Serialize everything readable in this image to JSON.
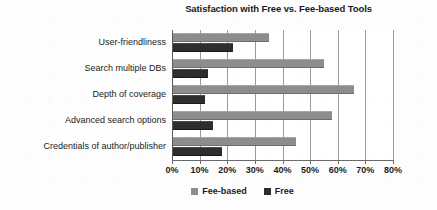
{
  "chart_data": {
    "type": "bar",
    "orientation": "horizontal",
    "title": "Satisfaction with Free vs. Fee-based Tools",
    "xlabel": "",
    "ylabel": "",
    "xlim": [
      0,
      80
    ],
    "xtick_labels": [
      "0%",
      "10%",
      "20%",
      "30%",
      "40%",
      "50%",
      "60%",
      "70%",
      "80%"
    ],
    "xticks": [
      0,
      10,
      20,
      30,
      40,
      50,
      60,
      70,
      80
    ],
    "grid": "vertical",
    "legend_position": "bottom",
    "categories": [
      "User-friendliness",
      "Search multiple DBs",
      "Depth of coverage",
      "Advanced search options",
      "Credentials of author/publisher"
    ],
    "series": [
      {
        "name": "Fee-based",
        "color": "#8d8d8d",
        "values": [
          35,
          55,
          66,
          58,
          45
        ]
      },
      {
        "name": "Free",
        "color": "#2e2e2e",
        "values": [
          22,
          13,
          12,
          15,
          18
        ]
      }
    ]
  },
  "legend": {
    "items": [
      {
        "label": "Fee-based",
        "swatch": "fee"
      },
      {
        "label": "Free",
        "swatch": "free"
      }
    ]
  }
}
